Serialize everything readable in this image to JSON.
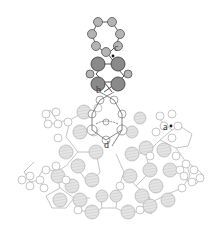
{
  "diagram": {
    "labels": [
      {
        "id": "a",
        "text": "a",
        "x": 160,
        "y": 128
      },
      {
        "id": "b",
        "text": "b",
        "x": 106,
        "y": 92
      },
      {
        "id": "c",
        "text": "c",
        "x": 116,
        "y": 50
      },
      {
        "id": "d",
        "text": "d",
        "x": 104,
        "y": 145
      }
    ],
    "colors": {
      "dark_atom": "#8c8c8c",
      "dark_small": "#b0b0b0",
      "framework_big": "#dcdcdc",
      "framework_small": "#ffffff",
      "stroke_dark": "#555555",
      "stroke_light": "#b8b8b8"
    }
  }
}
